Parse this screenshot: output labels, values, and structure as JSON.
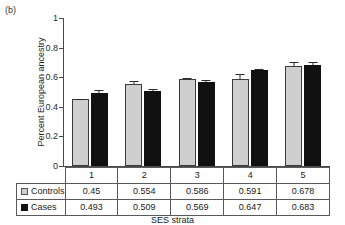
{
  "panel_label": "(b)",
  "chart_data": {
    "type": "bar",
    "title": "",
    "xlabel": "SES strata",
    "ylabel": "Percent European ancestry",
    "categories": [
      "1",
      "2",
      "3",
      "4",
      "5"
    ],
    "ylim": [
      0,
      1
    ],
    "yticks": [
      "0",
      "0.2",
      "0.4",
      "0.6",
      "0.8",
      "1"
    ],
    "grid": false,
    "legend_position": "table-row-headers",
    "series": [
      {
        "name": "Controls",
        "color": "#cfcfcf",
        "values": [
          0.45,
          0.554,
          0.586,
          0.591,
          0.678
        ],
        "errors": [
          0.005,
          0.018,
          0.009,
          0.028,
          0.022
        ]
      },
      {
        "name": "Cases",
        "color": "#111111",
        "values": [
          0.493,
          0.509,
          0.569,
          0.647,
          0.683
        ],
        "errors": [
          0.022,
          0.008,
          0.009,
          0.011,
          0.023
        ]
      }
    ]
  },
  "table": {
    "category_header_cells": [
      "1",
      "2",
      "3",
      "4",
      "5"
    ],
    "rows": [
      {
        "label": "Controls",
        "swatch": "controls-swatch",
        "cells": [
          "0.45",
          "0.554",
          "0.586",
          "0.591",
          "0.678"
        ]
      },
      {
        "label": "Cases",
        "swatch": "cases-swatch",
        "cells": [
          "0.493",
          "0.509",
          "0.569",
          "0.647",
          "0.683"
        ]
      }
    ]
  }
}
